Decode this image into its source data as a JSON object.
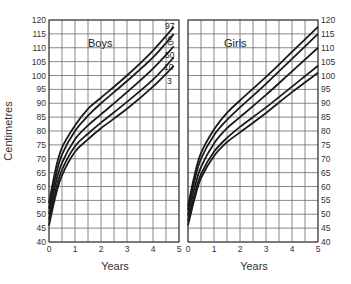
{
  "chart_data": [
    {
      "type": "line",
      "title": "Boys",
      "xlabel": "Years",
      "ylabel": "Centimetres",
      "xlim": [
        0,
        5
      ],
      "ylim": [
        40,
        120
      ],
      "xticks": [
        "0",
        "1",
        "2",
        "3",
        "4",
        "5"
      ],
      "yticks": [
        "40",
        "45",
        "50",
        "55",
        "60",
        "65",
        "70",
        "75",
        "80",
        "85",
        "90",
        "95",
        "100",
        "105",
        "110",
        "115",
        "120"
      ],
      "grid": true,
      "x": [
        0,
        0.25,
        0.5,
        1,
        1.5,
        2,
        3,
        4,
        4.8
      ],
      "series": [
        {
          "name": "97",
          "values": [
            54,
            66,
            74,
            82,
            88,
            92,
            100,
            109,
            117.5
          ]
        },
        {
          "name": "90",
          "values": [
            52,
            63.5,
            71.5,
            80,
            85.5,
            90,
            98,
            106.5,
            115
          ]
        },
        {
          "name": "50",
          "values": [
            50,
            61,
            68.5,
            77,
            82,
            86,
            94,
            102.5,
            110.5
          ]
        },
        {
          "name": "10",
          "values": [
            48,
            58.5,
            66,
            74.5,
            79,
            83,
            90.5,
            98.5,
            106.5
          ]
        },
        {
          "name": "3",
          "values": [
            46,
            56.5,
            64,
            72.5,
            77,
            81,
            88,
            96,
            103.5
          ]
        }
      ],
      "percentile_labels": [
        "97",
        "90",
        "50",
        "10",
        "3"
      ]
    },
    {
      "type": "line",
      "title": "Girls",
      "xlabel": "Years",
      "ylabel": "",
      "xlim": [
        0,
        5
      ],
      "ylim": [
        40,
        120
      ],
      "xticks": [
        "0",
        "1",
        "2",
        "3",
        "4",
        "5"
      ],
      "yticks": [
        "40",
        "45",
        "50",
        "55",
        "60",
        "65",
        "70",
        "75",
        "80",
        "85",
        "90",
        "95",
        "100",
        "105",
        "110",
        "115",
        "120"
      ],
      "grid": true,
      "x": [
        0,
        0.25,
        0.5,
        1,
        1.5,
        2,
        3,
        4,
        5
      ],
      "series": [
        {
          "name": "97",
          "values": [
            53,
            64,
            72,
            80.5,
            86.5,
            91,
            99.5,
            108.5,
            117.5
          ]
        },
        {
          "name": "90",
          "values": [
            51.5,
            62,
            70,
            78.5,
            84,
            88.5,
            97,
            106,
            115
          ]
        },
        {
          "name": "50",
          "values": [
            49.5,
            59.5,
            67,
            75.5,
            81,
            85,
            93,
            101.5,
            110
          ]
        },
        {
          "name": "10",
          "values": [
            47.5,
            57,
            64.5,
            72.5,
            77.5,
            81.5,
            88.5,
            96,
            103.5
          ]
        },
        {
          "name": "3",
          "values": [
            46,
            55.5,
            63,
            71,
            76,
            79.5,
            86.5,
            94,
            101
          ]
        }
      ]
    }
  ],
  "labels": {
    "boys_title": "Boys",
    "girls_title": "Girls",
    "y_axis_title": "Centimetres",
    "x_axis_title_left": "Years",
    "x_axis_title_right": "Years"
  }
}
